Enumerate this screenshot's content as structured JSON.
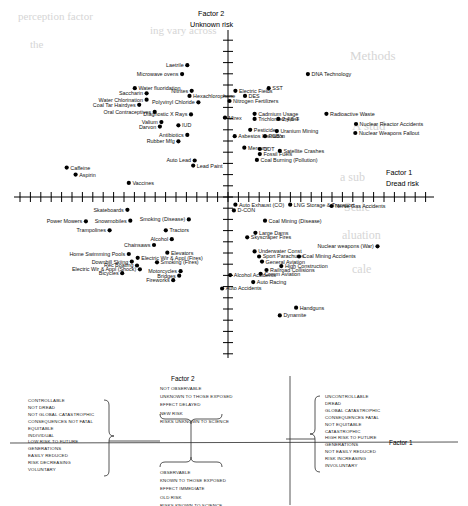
{
  "figure": {
    "vertical_axis_title_line1": "Factor 2",
    "vertical_axis_title_line2": "Unknown risk",
    "horizontal_axis_title_line1": "Factor 1",
    "horizontal_axis_title_line2": "Dread risk"
  },
  "chart_data": {
    "type": "scatter",
    "title": "",
    "xlabel": "Factor 1 — Dread risk",
    "ylabel": "Factor 2 — Unknown risk",
    "xlim": [
      -2.8,
      2.8
    ],
    "ylim": [
      -2.2,
      2.6
    ],
    "grid": false,
    "legend": "none",
    "axes_note": "Crossed axes through origin with evenly spaced unlabeled tick marks",
    "points": [
      {
        "label": "Laetrile",
        "x": -0.55,
        "y": 2.06,
        "side": "left"
      },
      {
        "label": "Microwave ovens",
        "x": -0.62,
        "y": 1.92,
        "side": "left"
      },
      {
        "label": "DNA Technology",
        "x": 1.08,
        "y": 1.92,
        "side": "right"
      },
      {
        "label": "Water fluoridation",
        "x": -1.26,
        "y": 1.7,
        "side": "right"
      },
      {
        "label": "Nitrites",
        "x": -0.49,
        "y": 1.66,
        "side": "left"
      },
      {
        "label": "Electric Fields",
        "x": 0.1,
        "y": 1.66,
        "side": "right"
      },
      {
        "label": "SST",
        "x": 0.55,
        "y": 1.7,
        "side": "right"
      },
      {
        "label": "Saccharin",
        "x": -1.1,
        "y": 1.62,
        "side": "left"
      },
      {
        "label": "Hexachlorophene",
        "x": -0.52,
        "y": 1.58,
        "side": "right"
      },
      {
        "label": "DES",
        "x": 0.23,
        "y": 1.58,
        "side": "right"
      },
      {
        "label": "Water Chlorination",
        "x": -1.1,
        "y": 1.52,
        "side": "left"
      },
      {
        "label": "Polyvinyl Chloride",
        "x": -0.4,
        "y": 1.48,
        "side": "left"
      },
      {
        "label": "Nitrogen Fertilizers",
        "x": 0.02,
        "y": 1.5,
        "side": "right"
      },
      {
        "label": "Coal Tar Hairdyes",
        "x": -1.2,
        "y": 1.44,
        "side": "left"
      },
      {
        "label": "Oral Contraceptives",
        "x": -0.99,
        "y": 1.33,
        "side": "left"
      },
      {
        "label": "Diagnostic X Rays",
        "x": -0.5,
        "y": 1.29,
        "side": "left"
      },
      {
        "label": "Cadmium Usage",
        "x": 0.36,
        "y": 1.3,
        "side": "right"
      },
      {
        "label": "Radioactive Waste",
        "x": 1.33,
        "y": 1.3,
        "side": "right"
      },
      {
        "label": "Mirex",
        "x": -0.04,
        "y": 1.24,
        "side": "right"
      },
      {
        "label": "Trichloroethylene",
        "x": 0.36,
        "y": 1.22,
        "side": "right"
      },
      {
        "label": "2,4,5-T",
        "x": 0.68,
        "y": 1.22,
        "side": "right"
      },
      {
        "label": "Valium",
        "x": -0.9,
        "y": 1.17,
        "side": "left"
      },
      {
        "label": "Darvon",
        "x": -0.92,
        "y": 1.1,
        "side": "left"
      },
      {
        "label": "IUD",
        "x": -0.67,
        "y": 1.12,
        "side": "right"
      },
      {
        "label": "Nuclear Reactor Accidents",
        "x": 1.73,
        "y": 1.14,
        "side": "right"
      },
      {
        "label": "Pesticides",
        "x": 0.3,
        "y": 1.05,
        "side": "right"
      },
      {
        "label": "Uranium Mining",
        "x": 0.66,
        "y": 1.03,
        "side": "right"
      },
      {
        "label": "Nuclear Weapons Fallout",
        "x": 1.72,
        "y": 1.0,
        "side": "right"
      },
      {
        "label": "Antibiotics",
        "x": -0.55,
        "y": 0.97,
        "side": "left"
      },
      {
        "label": "Asbestos Insulation",
        "x": 0.09,
        "y": 0.95,
        "side": "right"
      },
      {
        "label": "PCB's",
        "x": 0.5,
        "y": 0.95,
        "side": "right"
      },
      {
        "label": "Rubber Mfg",
        "x": -0.67,
        "y": 0.87,
        "side": "left"
      },
      {
        "label": "Mercury",
        "x": 0.22,
        "y": 0.77,
        "side": "right"
      },
      {
        "label": "DDT",
        "x": 0.43,
        "y": 0.75,
        "side": "right"
      },
      {
        "label": "Satellite Crashes",
        "x": 0.7,
        "y": 0.72,
        "side": "right"
      },
      {
        "label": "Fossil Fuels",
        "x": 0.43,
        "y": 0.67,
        "side": "right"
      },
      {
        "label": "Auto Lead",
        "x": -0.45,
        "y": 0.57,
        "side": "left"
      },
      {
        "label": "Coal Burning (Pollution)",
        "x": 0.39,
        "y": 0.58,
        "side": "right"
      },
      {
        "label": "Lead Paint",
        "x": -0.47,
        "y": 0.49,
        "side": "right"
      },
      {
        "label": "Caffeine",
        "x": -2.18,
        "y": 0.46,
        "side": "right"
      },
      {
        "label": "Aspirin",
        "x": -2.06,
        "y": 0.35,
        "side": "right"
      },
      {
        "label": "Vaccines",
        "x": -1.34,
        "y": 0.22,
        "side": "right"
      },
      {
        "label": "Auto Exhaust (CO)",
        "x": 0.1,
        "y": -0.12,
        "side": "right"
      },
      {
        "label": "LNG Storage & Transport",
        "x": 0.84,
        "y": -0.12,
        "side": "right"
      },
      {
        "label": "Nerve Gas Accidents",
        "x": 1.4,
        "y": -0.14,
        "side": "right"
      },
      {
        "label": "Skateboards",
        "x": -1.36,
        "y": -0.2,
        "side": "left"
      },
      {
        "label": "D-CON",
        "x": 0.08,
        "y": -0.21,
        "side": "right"
      },
      {
        "label": "Smoking (Disease)",
        "x": -0.53,
        "y": -0.35,
        "side": "left"
      },
      {
        "label": "Power Mowers",
        "x": -1.92,
        "y": -0.38,
        "side": "left"
      },
      {
        "label": "Snowmobiles",
        "x": -1.32,
        "y": -0.37,
        "side": "left"
      },
      {
        "label": "Coal Mining (Disease)",
        "x": 0.5,
        "y": -0.37,
        "side": "right"
      },
      {
        "label": "Trampolines",
        "x": -1.6,
        "y": -0.52,
        "side": "left"
      },
      {
        "label": "Tractors",
        "x": -0.84,
        "y": -0.52,
        "side": "right"
      },
      {
        "label": "Large Dams",
        "x": 0.37,
        "y": -0.56,
        "side": "right"
      },
      {
        "label": "Skyscraper Fires",
        "x": 0.26,
        "y": -0.63,
        "side": "right"
      },
      {
        "label": "Alcohol",
        "x": -0.76,
        "y": -0.66,
        "side": "left"
      },
      {
        "label": "Nuclear weapons (War)",
        "x": 2.02,
        "y": -0.77,
        "side": "left"
      },
      {
        "label": "Chainsaws",
        "x": -1.0,
        "y": -0.75,
        "side": "left"
      },
      {
        "label": "Elevators",
        "x": -0.82,
        "y": -0.87,
        "side": "right"
      },
      {
        "label": "Underwater Const",
        "x": 0.36,
        "y": -0.85,
        "side": "right"
      },
      {
        "label": "Home Swimming Pools",
        "x": -1.34,
        "y": -0.89,
        "side": "left"
      },
      {
        "label": "Electric Wir & Appl (Fires)",
        "x": -1.22,
        "y": -0.95,
        "side": "right"
      },
      {
        "label": "Sport Parachutes",
        "x": 0.42,
        "y": -0.93,
        "side": "right"
      },
      {
        "label": "Coal Mining Accidents",
        "x": 0.96,
        "y": -0.93,
        "side": "right"
      },
      {
        "label": "Downhill Skiing",
        "x": -1.3,
        "y": -1.01,
        "side": "left"
      },
      {
        "label": "Smoking (Fires)",
        "x": -0.96,
        "y": -1.02,
        "side": "right"
      },
      {
        "label": "General Aviation",
        "x": 0.46,
        "y": -1.01,
        "side": "right"
      },
      {
        "label": "Rec Boating",
        "x": -1.23,
        "y": -1.07,
        "side": "left"
      },
      {
        "label": "High Construction",
        "x": 0.72,
        "y": -1.08,
        "side": "right"
      },
      {
        "label": "Electric Wir & Appl (Shock)",
        "x": -1.19,
        "y": -1.13,
        "side": "left"
      },
      {
        "label": "Railroad Collisions",
        "x": 0.52,
        "y": -1.14,
        "side": "right"
      },
      {
        "label": "Motorcycles",
        "x": -0.64,
        "y": -1.16,
        "side": "left"
      },
      {
        "label": "Bicycles",
        "x": -1.43,
        "y": -1.19,
        "side": "left"
      },
      {
        "label": "Comm Aviation",
        "x": 0.44,
        "y": -1.2,
        "side": "right"
      },
      {
        "label": "Bridges",
        "x": -0.66,
        "y": -1.23,
        "side": "left"
      },
      {
        "label": "Alcohol Accidents",
        "x": 0.03,
        "y": -1.22,
        "side": "right"
      },
      {
        "label": "Fireworks",
        "x": -0.74,
        "y": -1.3,
        "side": "left"
      },
      {
        "label": "Auto Racing",
        "x": 0.34,
        "y": -1.33,
        "side": "right"
      },
      {
        "label": "Auto Accidents",
        "x": -0.08,
        "y": -1.43,
        "side": "right"
      },
      {
        "label": "Handguns",
        "x": 0.92,
        "y": -1.73,
        "side": "right"
      },
      {
        "label": "Dynamite",
        "x": 0.7,
        "y": -1.85,
        "side": "right"
      }
    ]
  },
  "legend": {
    "factor2_title": "Factor 2",
    "factor1_title": "Factor 1",
    "factor2_upper": [
      "NOT OBSERVABLE",
      "UNKNOWN TO THOSE EXPOSED",
      "EFFECT DELAYED",
      "NEW RISK",
      "RISKS UNKNOWN TO SCIENCE"
    ],
    "factor2_lower": [
      "OBSERVABLE",
      "KNOWN TO THOSE EXPOSED",
      "EFFECT IMMEDIATE",
      "OLD RISK",
      "RISKS KNOWN TO SCIENCE"
    ],
    "factor1_left": [
      "CONTROLLABLE",
      "NOT DREAD",
      "NOT GLOBAL CATASTROPHIC",
      "CONSEQUENCES NOT FATAL",
      "EQUITABLE",
      "INDIVIDUAL",
      "LOW RISK TO FUTURE",
      "     GENERATIONS",
      "EASILY REDUCED",
      "RISK DECREASING",
      "VOLUNTARY"
    ],
    "factor1_right": [
      "UNCONTROLLABLE",
      "DREAD",
      "GLOBAL CATASTROPHIC",
      "CONSEQUENCES FATAL",
      "NOT EQUITABLE",
      "CATASTROPHIC",
      "HIGH RISK TO FUTURE",
      "     GENERATIONS",
      "NOT EASILY REDUCED",
      "RISK INCREASING",
      "INVOLUNTARY"
    ]
  },
  "bleed_through": [
    {
      "text": "perception factor",
      "x": 18,
      "y": 10,
      "size": 11
    },
    {
      "text": "ing vary across",
      "x": 150,
      "y": 24,
      "size": 11
    },
    {
      "text": "the",
      "x": 30,
      "y": 38,
      "size": 11
    },
    {
      "text": "Methods",
      "x": 350,
      "y": 48,
      "size": 13
    },
    {
      "text": "A stud",
      "x": 352,
      "y": 118,
      "size": 13
    },
    {
      "text": "a sub",
      "x": 340,
      "y": 170,
      "size": 12
    },
    {
      "text": "Scale",
      "x": 344,
      "y": 200,
      "size": 12
    },
    {
      "text": "aluation",
      "x": 342,
      "y": 228,
      "size": 12
    },
    {
      "text": "cale",
      "x": 352,
      "y": 262,
      "size": 12
    }
  ]
}
